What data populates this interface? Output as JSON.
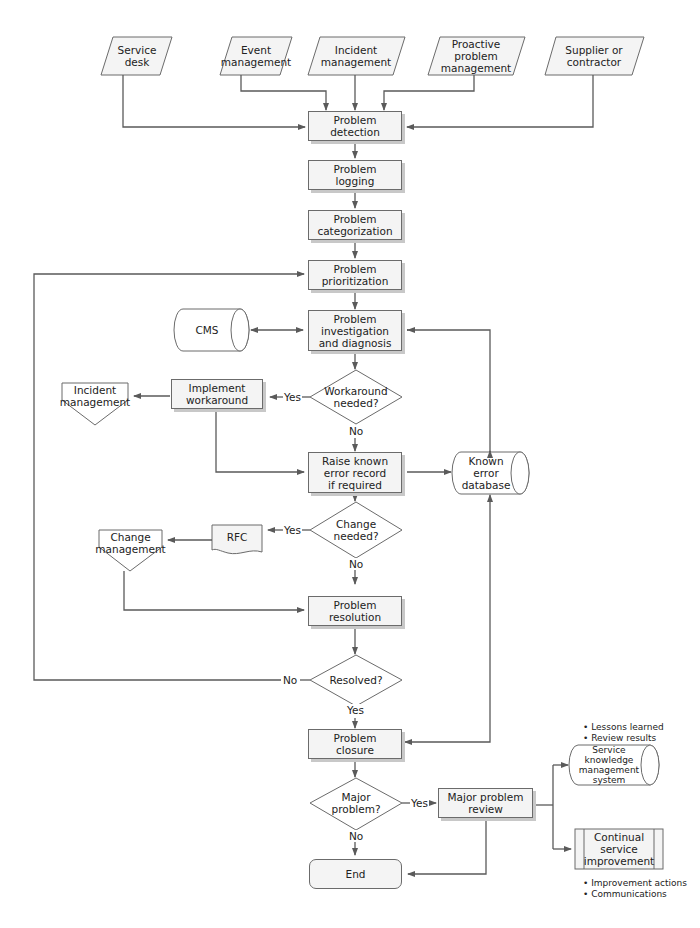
{
  "inputs": [
    {
      "id": "service_desk",
      "label": "Service\ndesk"
    },
    {
      "id": "event_mgmt",
      "label": "Event\nmanagement"
    },
    {
      "id": "incident_mgmt_in",
      "label": "Incident\nmanagement"
    },
    {
      "id": "proactive",
      "label": "Proactive\nproblem\nmanagement"
    },
    {
      "id": "supplier",
      "label": "Supplier or\ncontractor"
    }
  ],
  "process": {
    "detection": "Problem\ndetection",
    "logging": "Problem\nlogging",
    "categorization": "Problem\ncategorization",
    "prioritization": "Problem\nprioritization",
    "investigation": "Problem\ninvestigation\nand diagnosis",
    "raise_ker": "Raise known\nerror record\nif required",
    "resolution": "Problem\nresolution",
    "closure": "Problem\nclosure",
    "implement_workaround": "Implement\nworkaround",
    "major_review": "Major problem\nreview",
    "end": "End"
  },
  "decisions": {
    "workaround": "Workaround\nneeded?",
    "change": "Change\nneeded?",
    "resolved": "Resolved?",
    "major": "Major\nproblem?"
  },
  "branch_labels": {
    "yes": "Yes",
    "no": "No"
  },
  "datastores": {
    "cms": "CMS",
    "ked": "Known\nerror\ndatabase",
    "skms": "Service\nknowledge\nmanagement\nsystem"
  },
  "offpage": {
    "incident_mgmt_out": "Incident\nmanagement",
    "change_mgmt": "Change\nmanagement"
  },
  "documents": {
    "rfc": "RFC"
  },
  "predefined": {
    "csi": "Continual\nservice\nimprovement"
  },
  "notes": {
    "skms_notes": "• Lessons learned\n• Review results",
    "csi_notes": "• Improvement actions\n• Communications"
  },
  "colors": {
    "line": "#5a5a5a",
    "fill": "#f4f4f4",
    "shadow": "#c8c8c8"
  }
}
